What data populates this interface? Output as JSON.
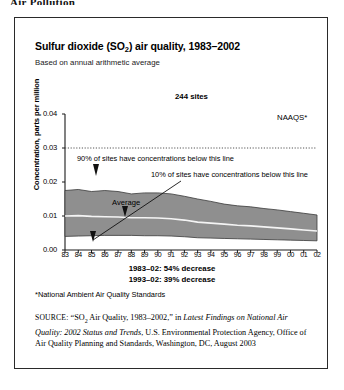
{
  "page": {
    "cropped_heading": "Air Pollution"
  },
  "figure": {
    "title_main": "Sulfur dioxide (SO",
    "title_sub": "2",
    "title_rest": ") air quality, 1983–2002",
    "subtitle": "Based on annual arithmetic average",
    "sites_label": "244 sites",
    "naaqs_label": "NAAQS*",
    "annotation_90": "90% of sites have concentrations below this line",
    "annotation_10": "10% of sites have concentrations below this line",
    "average_label": "Average",
    "decrease_line_1": "1983–02: 54% decrease",
    "decrease_line_2": "1993–02: 39% decrease",
    "footnote": "*National Ambient Air Quality Standards",
    "source_label": "SOURCE:",
    "source_text_1": "“SO",
    "source_sub": "2",
    "source_text_2": " Air Quality, 1983–2002,” in ",
    "source_italic": "Latest Findings on National Air Quality: 2002 Status and Trends",
    "source_text_3": ", U.S. Environmental Protection Agency, Office of Air Quality Planning and Standards, Washington, DC, August 2003"
  },
  "chart_data": {
    "type": "area",
    "title": "Sulfur dioxide (SO2) air quality, 1983–2002",
    "subtitle": "Based on annual arithmetic average",
    "xlabel": "",
    "ylabel": "Concentration, parts per million",
    "ylim": [
      0.0,
      0.04
    ],
    "yticks": [
      "0.00",
      "0.01",
      "0.02",
      "0.03",
      "0.04"
    ],
    "ytick_values": [
      0.0,
      0.01,
      0.02,
      0.03,
      0.04
    ],
    "grid": false,
    "legend_position": "inline-annotations",
    "categories": [
      "83",
      "84",
      "85",
      "86",
      "87",
      "88",
      "89",
      "90",
      "91",
      "92",
      "93",
      "94",
      "95",
      "96",
      "97",
      "98",
      "99",
      "00",
      "01",
      "02"
    ],
    "series": [
      {
        "name": "90th percentile",
        "values": [
          0.0175,
          0.0178,
          0.0172,
          0.0175,
          0.0172,
          0.0165,
          0.0168,
          0.0168,
          0.0165,
          0.0158,
          0.015,
          0.0143,
          0.0135,
          0.013,
          0.0127,
          0.0122,
          0.0118,
          0.0113,
          0.0108,
          0.0103
        ]
      },
      {
        "name": "Average",
        "values": [
          0.01,
          0.0101,
          0.0099,
          0.0098,
          0.0097,
          0.0095,
          0.0095,
          0.0094,
          0.0092,
          0.0088,
          0.0082,
          0.0079,
          0.0076,
          0.0073,
          0.0071,
          0.0068,
          0.0065,
          0.0062,
          0.0059,
          0.0056
        ]
      },
      {
        "name": "10th percentile",
        "values": [
          0.004,
          0.0041,
          0.0042,
          0.0043,
          0.0043,
          0.0043,
          0.0042,
          0.0042,
          0.0041,
          0.0039,
          0.0036,
          0.0035,
          0.0034,
          0.0033,
          0.0032,
          0.0031,
          0.003,
          0.0029,
          0.0028,
          0.0027
        ]
      }
    ],
    "reference_lines": [
      {
        "name": "NAAQS*",
        "value": 0.03,
        "style": "dotted"
      }
    ],
    "annotations": [
      {
        "text": "244 sites",
        "value": null
      },
      {
        "text": "90% of sites have concentrations below this line",
        "points_to": "90th percentile"
      },
      {
        "text": "10% of sites have concentrations below this line",
        "points_to": "10th percentile"
      },
      {
        "text": "Average",
        "points_to": "Average"
      },
      {
        "text": "1983–02: 54% decrease"
      },
      {
        "text": "1993–02: 39% decrease"
      }
    ],
    "colors": {
      "band": "#8f8f8f",
      "average_line": "#f2f2f2",
      "axis": "#1a1a1a"
    }
  }
}
